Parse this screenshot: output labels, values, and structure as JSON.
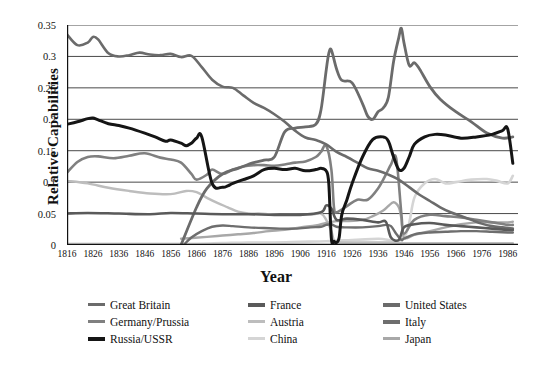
{
  "chart_data": {
    "type": "line",
    "title": "",
    "xlabel": "Year",
    "ylabel": "Relative Capabilities",
    "xlim": [
      1816,
      1990
    ],
    "ylim": [
      0,
      0.35
    ],
    "grid": true,
    "legend_position": "bottom",
    "x_ticks": [
      1816,
      1826,
      1836,
      1846,
      1856,
      1866,
      1876,
      1886,
      1896,
      1906,
      1916,
      1926,
      1936,
      1946,
      1956,
      1966,
      1976,
      1986
    ],
    "y_ticks": [
      "0",
      "0.05",
      "0.1",
      "0.15",
      "0.2",
      "0.25",
      "0.3",
      "0.35"
    ],
    "y_tick_values": [
      0,
      0.05,
      0.1,
      0.15,
      0.2,
      0.25,
      0.3,
      0.35
    ],
    "series": [
      {
        "name": "Great Britain",
        "color": "#6b6b6b",
        "width": 2.6,
        "x": [
          1816,
          1820,
          1824,
          1826,
          1828,
          1832,
          1836,
          1840,
          1844,
          1848,
          1852,
          1856,
          1860,
          1864,
          1868,
          1872,
          1876,
          1880,
          1884,
          1888,
          1892,
          1896,
          1900,
          1904,
          1908,
          1912,
          1916,
          1920,
          1924,
          1928,
          1932,
          1936,
          1940,
          1944,
          1948,
          1952,
          1956,
          1960,
          1964,
          1968,
          1972,
          1976,
          1980,
          1984,
          1988
        ],
        "y": [
          0.335,
          0.318,
          0.322,
          0.331,
          0.327,
          0.305,
          0.3,
          0.302,
          0.306,
          0.303,
          0.302,
          0.304,
          0.299,
          0.301,
          0.283,
          0.263,
          0.252,
          0.25,
          0.238,
          0.226,
          0.218,
          0.208,
          0.196,
          0.182,
          0.171,
          0.167,
          0.16,
          0.148,
          0.14,
          0.131,
          0.122,
          0.118,
          0.112,
          0.104,
          0.092,
          0.08,
          0.07,
          0.06,
          0.052,
          0.046,
          0.04,
          0.034,
          0.03,
          0.028,
          0.026
        ]
      },
      {
        "name": "France",
        "color": "#5a5a5a",
        "width": 2.6,
        "x": [
          1816,
          1824,
          1836,
          1848,
          1856,
          1866,
          1876,
          1886,
          1896,
          1906,
          1914,
          1916,
          1918,
          1920,
          1924,
          1930,
          1936,
          1939,
          1941,
          1944,
          1946,
          1950,
          1956,
          1962,
          1968,
          1974,
          1980,
          1986,
          1988
        ],
        "y": [
          0.05,
          0.051,
          0.05,
          0.049,
          0.051,
          0.05,
          0.049,
          0.049,
          0.048,
          0.048,
          0.052,
          0.063,
          0.058,
          0.04,
          0.042,
          0.04,
          0.036,
          0.037,
          0.012,
          0.008,
          0.028,
          0.033,
          0.035,
          0.032,
          0.03,
          0.028,
          0.026,
          0.024,
          0.024
        ]
      },
      {
        "name": "United States",
        "color": "#6b6b6b",
        "width": 2.8,
        "x": [
          1860,
          1866,
          1870,
          1876,
          1882,
          1888,
          1892,
          1896,
          1900,
          1904,
          1908,
          1912,
          1914,
          1916,
          1917,
          1918,
          1920,
          1922,
          1926,
          1930,
          1932,
          1934,
          1936,
          1938,
          1940,
          1942,
          1944,
          1945,
          1946,
          1948,
          1950,
          1952,
          1956,
          1960,
          1966,
          1972,
          1978,
          1984,
          1988
        ],
        "y": [
          0.0,
          0.06,
          0.09,
          0.113,
          0.122,
          0.131,
          0.135,
          0.14,
          0.18,
          0.186,
          0.188,
          0.192,
          0.215,
          0.278,
          0.305,
          0.31,
          0.28,
          0.262,
          0.258,
          0.225,
          0.205,
          0.2,
          0.212,
          0.218,
          0.235,
          0.292,
          0.33,
          0.345,
          0.322,
          0.286,
          0.29,
          0.28,
          0.252,
          0.232,
          0.212,
          0.196,
          0.178,
          0.17,
          0.172
        ]
      },
      {
        "name": "Germany/Prussia",
        "color": "#808080",
        "width": 2.6,
        "x": [
          1816,
          1820,
          1824,
          1828,
          1834,
          1840,
          1846,
          1852,
          1856,
          1860,
          1864,
          1866,
          1870,
          1872,
          1876,
          1880,
          1884,
          1888,
          1892,
          1896,
          1900,
          1904,
          1908,
          1912,
          1914,
          1916,
          1918,
          1919,
          1920,
          1924,
          1928,
          1932,
          1936,
          1939,
          1941,
          1943,
          1945,
          1946,
          1950,
          1956,
          1962,
          1968,
          1974,
          1980,
          1986,
          1988
        ],
        "y": [
          0.115,
          0.132,
          0.14,
          0.141,
          0.138,
          0.142,
          0.146,
          0.139,
          0.136,
          0.131,
          0.113,
          0.104,
          0.112,
          0.12,
          0.113,
          0.12,
          0.125,
          0.127,
          0.127,
          0.126,
          0.128,
          0.131,
          0.133,
          0.14,
          0.148,
          0.158,
          0.12,
          0.06,
          0.052,
          0.062,
          0.072,
          0.072,
          0.09,
          0.112,
          0.128,
          0.138,
          0.05,
          0.018,
          0.04,
          0.048,
          0.046,
          0.044,
          0.04,
          0.036,
          0.032,
          0.032
        ]
      },
      {
        "name": "Austria",
        "color": "#bdbdbd",
        "width": 2.4,
        "x": [
          1816,
          1824,
          1832,
          1840,
          1848,
          1856,
          1862,
          1866,
          1870,
          1874,
          1878,
          1882,
          1886,
          1890,
          1894,
          1898,
          1902,
          1906,
          1910,
          1914,
          1916,
          1918,
          1919,
          1920,
          1930,
          1940,
          1946,
          1956,
          1966,
          1976,
          1986,
          1988
        ],
        "y": [
          0.102,
          0.098,
          0.091,
          0.086,
          0.082,
          0.081,
          0.086,
          0.084,
          0.075,
          0.067,
          0.06,
          0.053,
          0.05,
          0.05,
          0.049,
          0.048,
          0.048,
          0.048,
          0.048,
          0.05,
          0.04,
          0.022,
          0.006,
          0.004,
          0.004,
          0.004,
          0.003,
          0.003,
          0.003,
          0.003,
          0.003,
          0.003
        ]
      },
      {
        "name": "Italy",
        "color": "#6e6e6e",
        "width": 2.4,
        "x": [
          1861,
          1864,
          1868,
          1872,
          1876,
          1880,
          1886,
          1892,
          1898,
          1904,
          1910,
          1914,
          1916,
          1918,
          1920,
          1924,
          1930,
          1936,
          1939,
          1941,
          1943,
          1945,
          1946,
          1950,
          1956,
          1962,
          1968,
          1974,
          1980,
          1986,
          1988
        ],
        "y": [
          0.0,
          0.012,
          0.022,
          0.029,
          0.031,
          0.03,
          0.028,
          0.027,
          0.026,
          0.026,
          0.028,
          0.029,
          0.032,
          0.033,
          0.029,
          0.028,
          0.028,
          0.03,
          0.032,
          0.03,
          0.018,
          0.008,
          0.01,
          0.017,
          0.02,
          0.021,
          0.022,
          0.022,
          0.021,
          0.02,
          0.02
        ]
      },
      {
        "name": "Russia/USSR",
        "color": "#151515",
        "width": 3.0,
        "x": [
          1816,
          1820,
          1824,
          1826,
          1828,
          1832,
          1836,
          1840,
          1846,
          1850,
          1854,
          1856,
          1860,
          1862,
          1864,
          1866,
          1868,
          1872,
          1876,
          1878,
          1880,
          1884,
          1888,
          1892,
          1896,
          1900,
          1904,
          1908,
          1912,
          1914,
          1916,
          1917,
          1918,
          1919,
          1920,
          1921,
          1922,
          1924,
          1926,
          1930,
          1934,
          1938,
          1940,
          1942,
          1944,
          1946,
          1948,
          1950,
          1954,
          1958,
          1962,
          1968,
          1974,
          1980,
          1984,
          1986,
          1988
        ],
        "y": [
          0.192,
          0.196,
          0.201,
          0.202,
          0.199,
          0.193,
          0.19,
          0.186,
          0.178,
          0.172,
          0.165,
          0.167,
          0.162,
          0.158,
          0.162,
          0.17,
          0.172,
          0.098,
          0.092,
          0.094,
          0.098,
          0.104,
          0.11,
          0.12,
          0.122,
          0.12,
          0.122,
          0.118,
          0.12,
          0.122,
          0.118,
          0.098,
          0.01,
          0.006,
          0.004,
          0.012,
          0.048,
          0.072,
          0.098,
          0.14,
          0.168,
          0.172,
          0.165,
          0.14,
          0.12,
          0.122,
          0.14,
          0.16,
          0.172,
          0.176,
          0.175,
          0.17,
          0.172,
          0.176,
          0.182,
          0.185,
          0.13
        ]
      },
      {
        "name": "China",
        "color": "#d5d5d5",
        "width": 2.6,
        "x": [
          1816,
          1836,
          1856,
          1866,
          1876,
          1886,
          1896,
          1906,
          1916,
          1926,
          1936,
          1946,
          1950,
          1954,
          1958,
          1962,
          1966,
          1972,
          1978,
          1982,
          1986,
          1988
        ],
        "y": [
          0.002,
          0.002,
          0.002,
          0.002,
          0.003,
          0.004,
          0.004,
          0.005,
          0.006,
          0.008,
          0.01,
          0.012,
          0.075,
          0.098,
          0.105,
          0.098,
          0.1,
          0.104,
          0.105,
          0.102,
          0.098,
          0.11
        ]
      },
      {
        "name": "Japan",
        "color": "#a8a8a8",
        "width": 2.4,
        "x": [
          1860,
          1870,
          1876,
          1882,
          1888,
          1894,
          1900,
          1906,
          1912,
          1916,
          1920,
          1924,
          1930,
          1934,
          1938,
          1940,
          1942,
          1944,
          1945,
          1946,
          1950,
          1956,
          1962,
          1968,
          1974,
          1980,
          1986,
          1988
        ],
        "y": [
          0.01,
          0.013,
          0.015,
          0.017,
          0.019,
          0.022,
          0.024,
          0.028,
          0.031,
          0.035,
          0.038,
          0.038,
          0.04,
          0.046,
          0.055,
          0.062,
          0.068,
          0.06,
          0.042,
          0.012,
          0.016,
          0.022,
          0.028,
          0.033,
          0.036,
          0.036,
          0.036,
          0.037
        ]
      }
    ]
  },
  "axis": {
    "y_title": "Relative Capabilities",
    "x_title": "Year"
  },
  "legend": {
    "items": [
      {
        "label": "Great Britain",
        "color": "#6b6b6b",
        "thick": false
      },
      {
        "label": "France",
        "color": "#5a5a5a",
        "thick": true
      },
      {
        "label": "United States",
        "color": "#6b6b6b",
        "thick": true
      },
      {
        "label": "Germany/Prussia",
        "color": "#808080",
        "thick": false
      },
      {
        "label": "Austria",
        "color": "#bdbdbd",
        "thick": false
      },
      {
        "label": "Italy",
        "color": "#6e6e6e",
        "thick": true
      },
      {
        "label": "Russia/USSR",
        "color": "#151515",
        "thick": true
      },
      {
        "label": "China",
        "color": "#d5d5d5",
        "thick": false
      },
      {
        "label": "Japan",
        "color": "#a8a8a8",
        "thick": false
      }
    ]
  },
  "colors": {
    "grid": "#4a4a4a",
    "axis": "#111111",
    "background": "#ffffff"
  }
}
